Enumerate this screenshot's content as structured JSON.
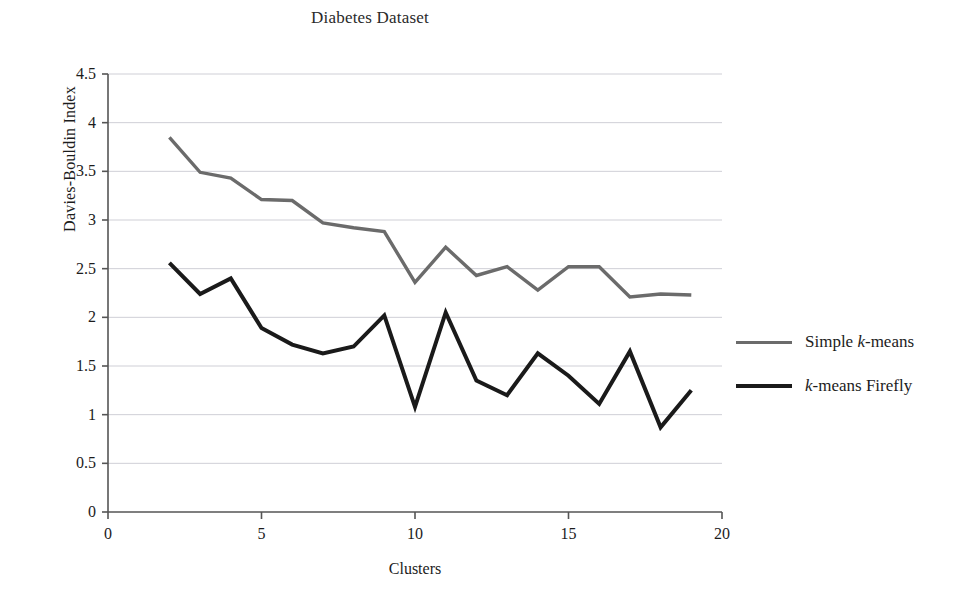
{
  "chart_data": {
    "type": "line",
    "title": "Diabetes Dataset",
    "xlabel": "Clusters",
    "ylabel": "Davies-Bouldin Index",
    "x": [
      2,
      3,
      4,
      5,
      6,
      7,
      8,
      9,
      10,
      11,
      12,
      13,
      14,
      15,
      16,
      17,
      18,
      19
    ],
    "xlim": [
      0,
      20
    ],
    "ylim": [
      0,
      4.5
    ],
    "xticks": [
      "0",
      "5",
      "10",
      "15",
      "20"
    ],
    "xtick_values": [
      0,
      5,
      10,
      15,
      20
    ],
    "yticks": [
      "0",
      "0.5",
      "1",
      "1.5",
      "2",
      "2.5",
      "3",
      "3.5",
      "4",
      "4.5"
    ],
    "ytick_values": [
      0,
      0.5,
      1,
      1.5,
      2,
      2.5,
      3,
      3.5,
      4,
      4.5
    ],
    "grid": "horizontal",
    "legend_position": "right",
    "series": [
      {
        "name": "Simple k-means",
        "color": "#6b6b6b",
        "width": 3.4,
        "values": [
          3.85,
          3.49,
          3.43,
          3.21,
          3.2,
          2.97,
          2.92,
          2.88,
          2.36,
          2.72,
          2.43,
          2.52,
          2.28,
          2.52,
          2.52,
          2.21,
          2.24,
          2.23
        ]
      },
      {
        "name": "k-means Firefly",
        "color": "#1a1a1a",
        "width": 4.0,
        "values": [
          2.56,
          2.24,
          2.4,
          1.89,
          1.72,
          1.63,
          1.7,
          2.02,
          1.08,
          2.05,
          1.35,
          1.2,
          1.63,
          1.4,
          1.11,
          1.65,
          0.87,
          1.25
        ]
      }
    ]
  },
  "legend": {
    "items": [
      {
        "prefix": "Simple ",
        "italic": "k",
        "suffix": "-means",
        "color": "#6b6b6b",
        "width": 3.4
      },
      {
        "prefix": "",
        "italic": "k",
        "suffix": "-means Firefly",
        "color": "#1a1a1a",
        "width": 4.2
      }
    ]
  },
  "axes": {
    "axis_color": "#555555",
    "grid_color": "#cfcfd6"
  }
}
